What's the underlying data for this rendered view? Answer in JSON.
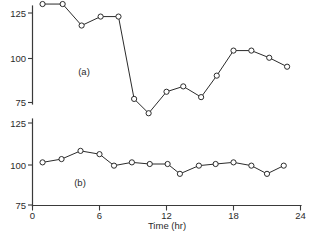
{
  "figure": {
    "background_color": "#ffffff",
    "line_color": "#2b2b2b",
    "axis_color": "#3a3a3a",
    "marker_fill": "#ffffff",
    "xlabel": "Time (hr)",
    "panel_a_label": "(a)",
    "panel_b_label": "(b)"
  },
  "chart_data": [
    {
      "type": "line",
      "title": "",
      "subtitle": "",
      "panel": "(a)",
      "xlabel": "Time (hr)",
      "ylabel": "",
      "xlim": [
        0,
        24
      ],
      "ylim": [
        75,
        131
      ],
      "xticks": [
        0,
        6,
        12,
        18,
        24
      ],
      "yticks": [
        75,
        100,
        125
      ],
      "xticklabels": [
        "0",
        "6",
        "12",
        "18",
        "24"
      ],
      "yticklabels": [
        "75",
        "100",
        "125"
      ],
      "grid": false,
      "legend": "none",
      "marker": "open-circle",
      "x": [
        0.9,
        2.7,
        4.4,
        6.1,
        7.7,
        9.1,
        10.4,
        12.0,
        13.5,
        15.1,
        16.5,
        18.0,
        19.6,
        21.2,
        22.8
      ],
      "y": [
        130,
        130,
        118,
        123,
        123,
        77,
        69,
        81,
        84,
        78,
        90,
        104,
        104,
        100,
        95
      ],
      "values": [
        130,
        130,
        118,
        123,
        123,
        77,
        69,
        81,
        84,
        78,
        90,
        104,
        104,
        100,
        95
      ]
    },
    {
      "type": "line",
      "title": "",
      "subtitle": "",
      "panel": "(b)",
      "xlabel": "Time (hr)",
      "ylabel": "",
      "xlim": [
        0,
        24
      ],
      "ylim": [
        75,
        125
      ],
      "xticks": [
        0,
        6,
        12,
        18,
        24
      ],
      "yticks": [
        75,
        100,
        125
      ],
      "xticklabels": [
        "0",
        "6",
        "12",
        "18",
        "24"
      ],
      "yticklabels": [
        "75",
        "100",
        "125"
      ],
      "grid": false,
      "legend": "none",
      "marker": "open-circle",
      "x": [
        0.9,
        2.6,
        4.3,
        6.0,
        7.3,
        8.9,
        10.5,
        12.1,
        13.2,
        14.9,
        16.4,
        18.0,
        19.6,
        21.0,
        22.5
      ],
      "y": [
        101,
        103,
        108,
        106,
        99,
        101,
        100,
        100,
        94,
        99,
        100,
        101,
        99,
        94,
        99
      ],
      "values": [
        101,
        103,
        108,
        106,
        99,
        101,
        100,
        100,
        94,
        99,
        100,
        101,
        99,
        94,
        99
      ]
    }
  ],
  "axes": {
    "y_a": {
      "ticks": [
        {
          "label": "125",
          "value": 125
        },
        {
          "label": "100",
          "value": 100
        },
        {
          "label": "75",
          "value": 75
        }
      ]
    },
    "y_b": {
      "ticks": [
        {
          "label": "125",
          "value": 125
        },
        {
          "label": "100",
          "value": 100
        },
        {
          "label": "75",
          "value": 75
        }
      ]
    },
    "x": {
      "ticks": [
        {
          "label": "0",
          "value": 0
        },
        {
          "label": "6",
          "value": 6
        },
        {
          "label": "12",
          "value": 12
        },
        {
          "label": "18",
          "value": 18
        },
        {
          "label": "24",
          "value": 24
        }
      ]
    }
  }
}
